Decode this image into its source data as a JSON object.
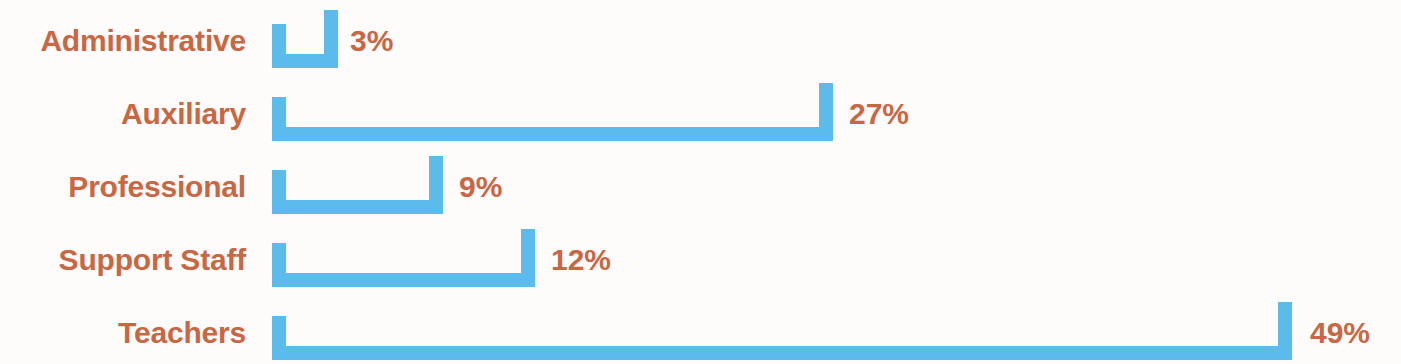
{
  "chart_data": {
    "type": "bar",
    "orientation": "horizontal",
    "title": "",
    "xlabel": "",
    "ylabel": "",
    "grid": false,
    "legend": false,
    "axis_visible": false,
    "value_suffix": "%",
    "xlim": [
      0,
      49
    ],
    "categories": [
      "Administrative",
      "Auxiliary",
      "Professional",
      "Support Staff",
      "Teachers"
    ],
    "values": [
      3,
      27,
      9,
      12,
      49
    ],
    "value_labels": [
      "3%",
      "27%",
      "9%",
      "12%",
      "49%"
    ],
    "colors": {
      "bar": "#5bbcec",
      "text": "#c96744",
      "background": "#fdfcfa"
    }
  },
  "rows": [
    {
      "label": "Administrative",
      "value": 3,
      "value_label": "3%",
      "bar_left": 272,
      "bar_width": 66,
      "label_left": 350,
      "row_top": 2,
      "label_top": 24,
      "value_top": 24
    },
    {
      "label": "Auxiliary",
      "value": 27,
      "value_label": "27%",
      "bar_left": 272,
      "bar_width": 561,
      "label_left": 849,
      "row_top": 75,
      "label_top": 24,
      "value_top": 24
    },
    {
      "label": "Professional",
      "value": 9,
      "value_label": "9%",
      "bar_left": 272,
      "bar_width": 171,
      "label_left": 459,
      "row_top": 148,
      "label_top": 24,
      "value_top": 24
    },
    {
      "label": "Support Staff",
      "value": 12,
      "value_label": "12%",
      "bar_left": 272,
      "bar_width": 263,
      "label_left": 551,
      "row_top": 221,
      "label_top": 24,
      "value_top": 24
    },
    {
      "label": "Teachers",
      "value": 49,
      "value_label": "49%",
      "bar_left": 272,
      "bar_width": 1020,
      "label_left": 1310,
      "row_top": 294,
      "label_top": 24,
      "value_top": 24
    }
  ]
}
